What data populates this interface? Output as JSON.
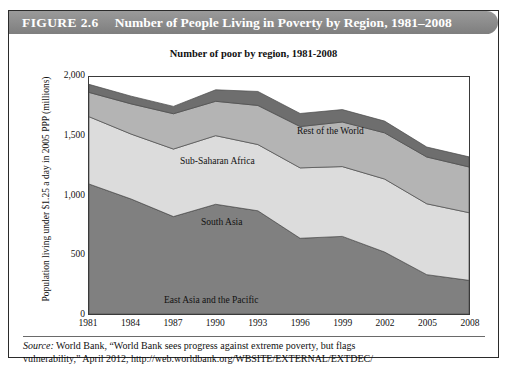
{
  "figure": {
    "number_label": "FIGURE 2.6",
    "title": "Number of People Living in Poverty by Region, 1981–2008",
    "banner_color": "#8e8e8e"
  },
  "source": {
    "prefix": "Source:",
    "line1": " World Bank, “World Bank sees progress against extreme poverty, but flags",
    "line2": "vulnerability,” April 2012, http://web.worldbank.org/WBSITE/EXTERNAL/EXTDEC/"
  },
  "chart_data": {
    "type": "area",
    "title": "Number of poor by region, 1981-2008",
    "xlabel": "",
    "ylabel": "Population living under $1.25 a day in 2005 PPP (millions)",
    "stacked": true,
    "grid": false,
    "legend_position": "inline-labels",
    "xlim": [
      1981,
      2008
    ],
    "ylim": [
      0,
      2000
    ],
    "yticks": [
      0,
      500,
      1000,
      1500,
      2000
    ],
    "ytick_labels": [
      "0",
      "500",
      "1,000",
      "1,500",
      "2,000"
    ],
    "x": [
      1981,
      1984,
      1987,
      1990,
      1993,
      1996,
      1999,
      2002,
      2005,
      2008
    ],
    "xtick_labels": [
      "1981",
      "1984",
      "1987",
      "1990",
      "1993",
      "1996",
      "1999",
      "2002",
      "2005",
      "2008"
    ],
    "categories": [
      "1981",
      "1984",
      "1987",
      "1990",
      "1993",
      "1996",
      "1999",
      "2002",
      "2005",
      "2008"
    ],
    "series": [
      {
        "name": "East Asia and the Pacific",
        "color": "#808080",
        "values": [
          1097,
          970,
          822,
          926,
          871,
          639,
          655,
          523,
          332,
          284
        ]
      },
      {
        "name": "South Asia",
        "color": "#dcdcdc",
        "values": [
          568,
          548,
          570,
          579,
          559,
          594,
          589,
          616,
          598,
          571
        ]
      },
      {
        "name": "Sub-Saharan Africa",
        "color": "#b4b4b4",
        "values": [
          205,
          255,
          298,
          290,
          330,
          349,
          376,
          390,
          395,
          386
        ]
      },
      {
        "name": "Rest of the World",
        "color": "#6e6e6e",
        "values": [
          68,
          65,
          62,
          97,
          118,
          110,
          105,
          99,
          84,
          85
        ]
      }
    ],
    "series_label_positions": [
      {
        "name": "Rest of the World",
        "x_px": 288,
        "y_px": 90
      },
      {
        "name": "Sub-Saharan Africa",
        "x_px": 171,
        "y_px": 120
      },
      {
        "name": "South Asia",
        "x_px": 192,
        "y_px": 181
      },
      {
        "name": "East Asia and the Pacific",
        "x_px": 155,
        "y_px": 259
      }
    ],
    "totals": [
      1938,
      1838,
      1752,
      1892,
      1878,
      1692,
      1725,
      1628,
      1409,
      1326
    ]
  }
}
